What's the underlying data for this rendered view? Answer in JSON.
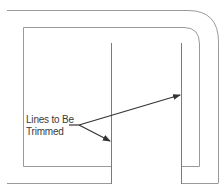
{
  "diagram": {
    "type": "cad-wall-plan",
    "annotation": {
      "line1": "Lines to Be",
      "line2": "Trimmed"
    },
    "colors": {
      "wall_line": "#9a9a9a",
      "leader_line": "#333333",
      "text": "#3a3a3a",
      "background": "#ffffff"
    }
  }
}
